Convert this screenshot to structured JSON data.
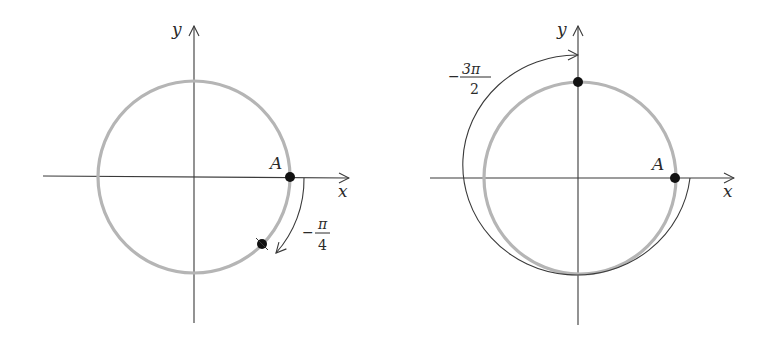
{
  "figures": [
    {
      "id": "left",
      "axis_labels": {
        "x": "x",
        "y": "y"
      },
      "point_label": "A",
      "angle_label": {
        "sign": "−",
        "numerator": "π",
        "denominator": "4"
      },
      "angle_value": "-π/4",
      "description": "Unit circle with point A at (1,0) rotated by -π/4 clockwise"
    },
    {
      "id": "right",
      "axis_labels": {
        "x": "x",
        "y": "y"
      },
      "point_label": "A",
      "angle_label": {
        "sign": "−",
        "numerator": "3π",
        "denominator": "2"
      },
      "angle_value": "-3π/2",
      "description": "Unit circle with point A at (1,0) rotated by -3π/2 clockwise ending at (0,1)"
    }
  ],
  "colors": {
    "circle": "#b5b5b5",
    "axis": "#3a3a3a",
    "point": "#111111",
    "background": "#ffffff"
  }
}
